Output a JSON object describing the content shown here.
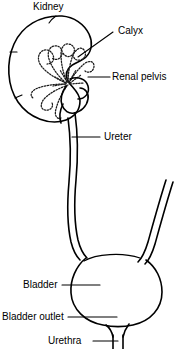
{
  "figure": {
    "name": "urinary-tract-diagram",
    "background_color": "#ffffff",
    "line_color": "#000000",
    "width": 176,
    "height": 349
  },
  "labels": {
    "kidney": "Kidney",
    "calyx": "Calyx",
    "renal_pelvis": "Renal pelvis",
    "ureter": "Ureter",
    "bladder": "Bladder",
    "bladder_outlet": "Bladder outlet",
    "urethra": "Urethra"
  },
  "structures": [
    {
      "id": "kidney",
      "label": "Kidney",
      "description": "bean-shaped organ upper left"
    },
    {
      "id": "calyx",
      "label": "Calyx",
      "description": "cup-shaped collecting chamber within kidney"
    },
    {
      "id": "renal-pelvis",
      "label": "Renal pelvis",
      "description": "funnel at kidney hilum"
    },
    {
      "id": "ureter",
      "label": "Ureter",
      "description": "tube from renal pelvis to bladder"
    },
    {
      "id": "bladder",
      "label": "Bladder",
      "description": "round reservoir at lower centre"
    },
    {
      "id": "bladder-outlet",
      "label": "Bladder outlet",
      "description": "neck at base of bladder"
    },
    {
      "id": "urethra",
      "label": "Urethra",
      "description": "tube exiting bladder outlet"
    }
  ]
}
